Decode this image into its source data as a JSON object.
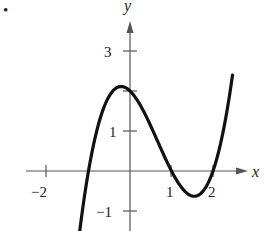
{
  "bullet": "•",
  "chart_data": {
    "type": "line",
    "title": "",
    "xlabel": "x",
    "ylabel": "y",
    "xlim": [
      -2.1,
      2.6
    ],
    "ylim": [
      -1.5,
      4.2
    ],
    "grid": false,
    "legend": null,
    "x_ticks": [
      -2,
      1,
      2
    ],
    "x_tick_labels": [
      "−2",
      "1",
      "2"
    ],
    "y_ticks": [
      3,
      1,
      -1
    ],
    "y_tick_labels": [
      "3",
      "1",
      "−1"
    ],
    "unlabeled_y_ticks": [
      2
    ],
    "series": [
      {
        "name": "f(x)",
        "description": "cubic through zeros at x = -1, 1, 2; y-intercept 2; local max ≈ (-0.2, 2.1); local min ≈ (1.55, -0.63)",
        "x": [
          -1.2,
          -1.0,
          -0.8,
          -0.6,
          -0.4,
          -0.2,
          0.0,
          0.2,
          0.4,
          0.6,
          0.8,
          1.0,
          1.2,
          1.4,
          1.55,
          1.8,
          2.0,
          2.2,
          2.4,
          2.5
        ],
        "values": [
          -1.57,
          0.0,
          0.97,
          1.86,
          2.02,
          2.11,
          2.0,
          1.73,
          1.34,
          0.9,
          0.43,
          0.0,
          -0.35,
          -0.58,
          -0.63,
          -0.43,
          0.0,
          0.62,
          1.51,
          2.03
        ]
      }
    ]
  },
  "labels": {
    "x_axis": "x",
    "y_axis": "y",
    "tick_x_neg2": "−2",
    "tick_x_1": "1",
    "tick_x_2": "2",
    "tick_y_3": "3",
    "tick_y_1": "1",
    "tick_y_neg1": "−1"
  }
}
